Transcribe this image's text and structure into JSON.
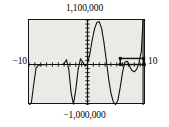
{
  "figure": {
    "kind": "graphing-calculator-plot",
    "background_color": "#eceae7",
    "frame_color": "#151515",
    "curve_color": "#111111",
    "page_background": "#ffffff"
  },
  "labels": {
    "y_max": "1,100,000",
    "y_min": "−1,000,000",
    "x_min": "−10",
    "x_max": "10"
  },
  "chart_data": {
    "type": "line",
    "title": "",
    "xlabel": "",
    "ylabel": "",
    "xlim": [
      -10,
      10
    ],
    "ylim": [
      -1000000,
      1100000
    ],
    "grid": false,
    "legend": false,
    "axes": {
      "x_axis_at_y": 0,
      "y_axis_at_x": 0,
      "x_tick_spacing": 1,
      "y_tick_spacing": 100000,
      "tick_marks": true
    },
    "annotations": [
      {
        "name": "selection-box",
        "type": "rectangle",
        "x0": 5.6,
        "x1": 9.6,
        "y0": 0,
        "y1": 150000,
        "note": "dark zoom/selection rectangle drawn over the right side of the curve"
      },
      {
        "name": "vertical-asymptote-right",
        "type": "vline",
        "x": 9.5
      }
    ],
    "series": [
      {
        "name": "polynomial",
        "x": [
          -10.0,
          -9.6,
          -9.2,
          -8.8,
          -8.4,
          -8.0,
          -7.6,
          -7.2,
          -6.8,
          -6.4,
          -6.0,
          -5.6,
          -5.2,
          -4.8,
          -4.4,
          -4.0,
          -3.6,
          -3.2,
          -2.8,
          -2.4,
          -2.0,
          -1.6,
          -1.2,
          -0.8,
          -0.4,
          0.0,
          0.4,
          0.8,
          1.2,
          1.6,
          2.0,
          2.4,
          2.8,
          3.2,
          3.6,
          4.0,
          4.4,
          4.8,
          5.2,
          5.6,
          6.0,
          6.4,
          6.8,
          7.2,
          7.6,
          8.0,
          8.4,
          8.8,
          9.2,
          9.5,
          9.6,
          9.7,
          9.8
        ],
        "y": [
          -1000000,
          -950000,
          -500000,
          -90000,
          -20000,
          -8000,
          -3000,
          -1500,
          -800,
          -400,
          -200,
          -100,
          -50,
          -20,
          0,
          20000,
          120000,
          -120000,
          -700000,
          -980000,
          -620000,
          -120000,
          140000,
          60000,
          -40000,
          20000,
          260000,
          600000,
          880000,
          1040000,
          1060000,
          900000,
          560000,
          120000,
          -340000,
          -700000,
          -920000,
          -990000,
          -880000,
          -560000,
          -180000,
          60000,
          80000,
          -40000,
          -150000,
          -180000,
          -120000,
          40000,
          320000,
          1100000,
          1100000,
          1100000,
          1100000
        ]
      }
    ]
  }
}
